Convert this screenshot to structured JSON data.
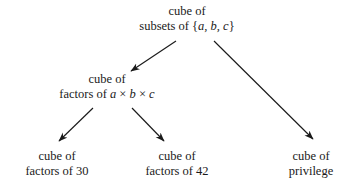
{
  "diagram": {
    "type": "tree",
    "background_color": "#ffffff",
    "ink_color": "#1a1a1a",
    "nodes": [
      {
        "id": "root",
        "line1": "cube of",
        "line2_prefix": "subsets of {",
        "line2_vars": "a, b, c",
        "line2_suffix": "}"
      },
      {
        "id": "factors-abc",
        "line1": "cube of",
        "line2_prefix": "factors of ",
        "line2_a": "a",
        "line2_times1": " × ",
        "line2_b": "b",
        "line2_times2": " × ",
        "line2_c": "c"
      },
      {
        "id": "factors-30",
        "line1": "cube of",
        "line2": "factors of 30"
      },
      {
        "id": "factors-42",
        "line1": "cube of",
        "line2": "factors of 42"
      },
      {
        "id": "privilege",
        "line1": "cube of",
        "line2": "privilege"
      }
    ],
    "edges": [
      {
        "id": "root-to-factors",
        "from": "root",
        "to": "factors-abc"
      },
      {
        "id": "root-to-privilege",
        "from": "root",
        "to": "privilege"
      },
      {
        "id": "factors-to-30",
        "from": "factors-abc",
        "to": "factors-30"
      },
      {
        "id": "factors-to-42",
        "from": "factors-abc",
        "to": "factors-42"
      }
    ]
  }
}
